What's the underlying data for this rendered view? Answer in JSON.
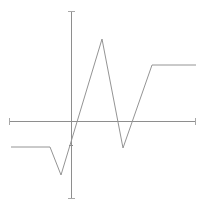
{
  "figure": {
    "title": "",
    "background_color": "#ffffff",
    "width": 205,
    "height": 210
  },
  "axes": {
    "line_color": "#8e8e8e",
    "serif_color": "#a8a8a8",
    "x_axis": {
      "name": "horizontal-axis",
      "y_pixel": 121,
      "x_start_pixel": 9,
      "x_end_pixel": 196,
      "end_serifs": true,
      "label": "",
      "tick_labels": []
    },
    "y_axis": {
      "name": "vertical-axis",
      "x_pixel": 71,
      "y_start_pixel": 11,
      "y_end_pixel": 199,
      "end_serifs": true,
      "label": "",
      "tick_labels": [],
      "interior_tick_y_pixel": 145
    }
  },
  "chart_data": {
    "type": "line",
    "title": "",
    "subtitle": "",
    "xlabel": "",
    "ylabel": "",
    "grid": false,
    "legend": null,
    "legend_position": "none",
    "series": [
      {
        "name": "waveform",
        "color": "#949494",
        "line_width": 1,
        "interpolation": "linear",
        "points_pixel": [
          [
            11,
            147
          ],
          [
            50,
            147
          ],
          [
            61,
            175
          ],
          [
            102,
            39
          ],
          [
            123,
            148
          ],
          [
            152,
            65
          ],
          [
            196,
            65
          ]
        ],
        "x": [
          -5.0,
          -2.1,
          -1.3,
          1.8,
          3.4,
          5.6,
          8.9
        ],
        "values": [
          -0.45,
          -0.45,
          -1.0,
          1.9,
          -0.5,
          1.12,
          1.12
        ]
      }
    ],
    "xlim": [
      -5.0,
      8.9
    ],
    "ylim": [
      -1.05,
      1.95
    ],
    "annotations": []
  }
}
